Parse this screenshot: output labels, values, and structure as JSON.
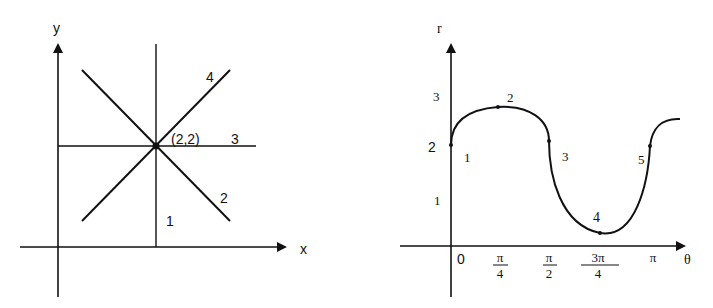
{
  "colors": {
    "ink": "#111111",
    "background": "#ffffff"
  },
  "left_diagram": {
    "x_axis_label": "x",
    "y_axis_label": "y",
    "intersection_label": "(2,2)",
    "line_labels": [
      "1",
      "2",
      "3",
      "4"
    ],
    "lines": [
      {
        "id": "1",
        "kind": "vertical",
        "description": "x = 2"
      },
      {
        "id": "2",
        "kind": "diagonal-descending",
        "description": "slope -1 through (2,2)"
      },
      {
        "id": "3",
        "kind": "horizontal",
        "description": "y = 2"
      },
      {
        "id": "4",
        "kind": "diagonal-ascending",
        "description": "slope +1 through (2,2)"
      }
    ]
  },
  "right_diagram": {
    "x_axis_label": "θ",
    "y_axis_label": "r",
    "y_ticks": [
      "1",
      "2",
      "3"
    ],
    "x_ticks": [
      {
        "num": "0",
        "den": ""
      },
      {
        "num": "π",
        "den": "4"
      },
      {
        "num": "π",
        "den": "2"
      },
      {
        "num": "3π",
        "den": "4"
      },
      {
        "num": "π",
        "den": ""
      }
    ],
    "point_labels": [
      "1",
      "2",
      "3",
      "4",
      "5"
    ],
    "points": [
      {
        "label": "1",
        "theta": "0",
        "r": 2
      },
      {
        "label": "2",
        "theta": "π/4",
        "r": 2.75
      },
      {
        "label": "3",
        "theta": "π/2",
        "r": 2.1
      },
      {
        "label": "4",
        "theta": "3π/4",
        "r": 0.25
      },
      {
        "label": "5",
        "theta": "π",
        "r": 2
      }
    ]
  }
}
